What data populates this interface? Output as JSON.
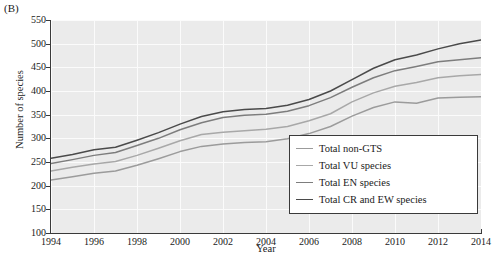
{
  "panel": {
    "label": "(B)"
  },
  "chart_data": {
    "type": "line",
    "title": "",
    "xlabel": "Year",
    "ylabel": "Number of species",
    "xlim": [
      1994,
      2014
    ],
    "ylim": [
      100,
      550
    ],
    "xticks": [
      1994,
      1996,
      1998,
      2000,
      2002,
      2004,
      2006,
      2008,
      2010,
      2012,
      2014
    ],
    "yticks": [
      100,
      150,
      200,
      250,
      300,
      350,
      400,
      450,
      500,
      550
    ],
    "grid": true,
    "legend_position": "bottom-right",
    "x": [
      1994,
      1995,
      1996,
      1997,
      1998,
      1999,
      2000,
      2001,
      2002,
      2003,
      2004,
      2005,
      2006,
      2007,
      2008,
      2009,
      2010,
      2011,
      2012,
      2013,
      2014
    ],
    "series": [
      {
        "name": "Total CR and EW species",
        "color": "#4a4a4a",
        "values": [
          258,
          266,
          276,
          281,
          296,
          312,
          330,
          346,
          356,
          361,
          363,
          370,
          382,
          400,
          424,
          448,
          466,
          476,
          489,
          500,
          508
        ]
      },
      {
        "name": "Total EN species",
        "color": "#7d7d7d",
        "values": [
          247,
          255,
          264,
          270,
          285,
          300,
          318,
          333,
          344,
          349,
          351,
          357,
          369,
          386,
          408,
          428,
          443,
          452,
          462,
          466,
          470
        ]
      },
      {
        "name": "Total VU species",
        "color": "#a8a8a8",
        "values": [
          231,
          239,
          246,
          251,
          264,
          279,
          295,
          308,
          313,
          316,
          319,
          325,
          337,
          352,
          377,
          396,
          410,
          418,
          428,
          432,
          435
        ]
      },
      {
        "name": "Total non-GTS",
        "color": "#9b9b9b",
        "values": [
          212,
          219,
          226,
          231,
          243,
          257,
          272,
          283,
          288,
          291,
          293,
          299,
          310,
          325,
          347,
          365,
          377,
          374,
          385,
          387,
          388
        ]
      }
    ],
    "legend_entries": [
      {
        "label": "Total non-GTS",
        "color": "#9b9b9b"
      },
      {
        "label": "Total VU species",
        "color": "#a8a8a8"
      },
      {
        "label": "Total EN species",
        "color": "#7d7d7d"
      },
      {
        "label": "Total CR and EW species",
        "color": "#4a4a4a"
      }
    ],
    "colors": {
      "plot_background": "#ebebeb",
      "gridline": "#fbfbfb",
      "axis": "#3a3a3a",
      "page_background": "#ffffff"
    }
  }
}
